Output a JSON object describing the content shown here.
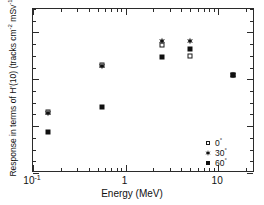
{
  "chart_data": {
    "type": "scatter",
    "title": "",
    "xlabel": "Energy (MeV)",
    "ylabel": "Response in terms of H'(10) (tracks cm-2 mSv-1)",
    "ylabel_parts": {
      "main": "Response in terms of H'(10) (tracks cm",
      "sup1": "-2",
      "mid": " mSv",
      "sup2": "-1",
      "tail": ")"
    },
    "xscale": "log",
    "yscale": "linear",
    "xlim": [
      0.1,
      25
    ],
    "ylim": [
      0,
      700
    ],
    "grid": false,
    "legend_position": "bottom-right",
    "xticks": [
      0.1,
      1,
      10
    ],
    "xtick_labels": [
      "10-1",
      "1",
      "10"
    ],
    "xtick_label_parts": [
      {
        "base": "10",
        "sup": "-1"
      },
      {
        "base": "1",
        "sup": ""
      },
      {
        "base": "10",
        "sup": ""
      }
    ],
    "yticks": [
      0,
      200,
      400,
      600
    ],
    "ytick_labels": [
      "0",
      "200",
      "400",
      "600"
    ],
    "ytick_minor_step": 50,
    "series": [
      {
        "name": "0°",
        "marker": "open-square",
        "color": "#1a1a1a",
        "points": [
          {
            "x": 0.144,
            "y": 262
          },
          {
            "x": 0.55,
            "y": 462
          },
          {
            "x": 2.5,
            "y": 545
          },
          {
            "x": 5.0,
            "y": 500
          },
          {
            "x": 14.5,
            "y": 420
          }
        ]
      },
      {
        "name": "30°",
        "marker": "star",
        "color": "#101010",
        "points": [
          {
            "x": 0.144,
            "y": 258
          },
          {
            "x": 0.55,
            "y": 455
          },
          {
            "x": 2.5,
            "y": 565
          },
          {
            "x": 5.0,
            "y": 565
          },
          {
            "x": 14.5,
            "y": 420
          }
        ]
      },
      {
        "name": "60°",
        "marker": "filled-square",
        "color": "#101010",
        "points": [
          {
            "x": 0.144,
            "y": 175
          },
          {
            "x": 0.55,
            "y": 280
          },
          {
            "x": 2.5,
            "y": 495
          },
          {
            "x": 5.0,
            "y": 530
          },
          {
            "x": 14.5,
            "y": 420
          }
        ]
      }
    ]
  },
  "legend": {
    "entries": [
      {
        "label": "0",
        "degree": "°",
        "marker": "open-square"
      },
      {
        "label": "30",
        "degree": "°",
        "marker": "star"
      },
      {
        "label": "60",
        "degree": "°",
        "marker": "filled-square"
      }
    ]
  },
  "axes": {
    "x_title": "Energy (MeV)",
    "y_title": "Response in terms of H'(10) (tracks cm-2 mSv-1)"
  }
}
